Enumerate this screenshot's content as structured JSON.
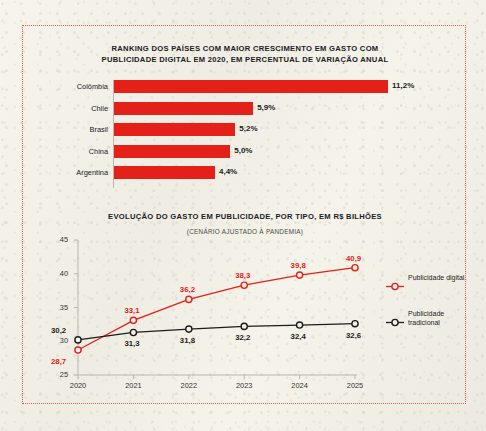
{
  "frame": {
    "border_color": "#e05a4a"
  },
  "palette": {
    "red": "#e32119",
    "black": "#1c1c1a",
    "paper": "#f3f1e9",
    "axis_gray": "#b9b7ad"
  },
  "chart_data": [
    {
      "type": "bar",
      "orientation": "horizontal",
      "title": "RANKING DOS PAÍSES COM MAIOR CRESCIMENTO EM GASTO COM PUBLICIDADE DIGITAL EM 2020, EM PERCENTUAL DE VARIAÇÃO ANUAL",
      "categories": [
        "Colômbia",
        "Chile",
        "Brasil",
        "China",
        "Argentina"
      ],
      "values": [
        11.2,
        5.9,
        5.2,
        5.0,
        4.4
      ],
      "value_labels": [
        "11,2%",
        "5,9%",
        "5,2%",
        "5,0%",
        "4,4%"
      ],
      "xlabel": "",
      "ylabel": "",
      "grid": false,
      "legend": "none",
      "series_color": "#e32119"
    },
    {
      "type": "line",
      "title": "EVOLUÇÃO DO GASTO EM PUBLICIDADE, POR TIPO, EM R$ BILHÕES",
      "subtitle": "(CENÁRIO AJUSTADO À PANDEMIA)",
      "x": [
        "2020",
        "2021",
        "2022",
        "2023",
        "2024",
        "2025"
      ],
      "ylim": [
        25,
        45
      ],
      "yticks": [
        25,
        30,
        35,
        40,
        45
      ],
      "ytick_labels": [
        "25",
        "30",
        "35",
        "40",
        "45"
      ],
      "grid": false,
      "legend_position": "right",
      "series": [
        {
          "name": "Publicidade digital",
          "color": "#e32119",
          "values": [
            28.7,
            33.1,
            36.2,
            38.3,
            39.8,
            40.9
          ],
          "value_labels": [
            "28,7",
            "33,1",
            "36,2",
            "38,3",
            "39,8",
            "40,9"
          ]
        },
        {
          "name": "Publicidade tradicional",
          "color": "#1c1c1a",
          "values": [
            30.2,
            31.3,
            31.8,
            32.2,
            32.4,
            32.6
          ],
          "value_labels": [
            "30,2",
            "31,3",
            "31,8",
            "32,2",
            "32,4",
            "32,6"
          ]
        }
      ]
    }
  ]
}
